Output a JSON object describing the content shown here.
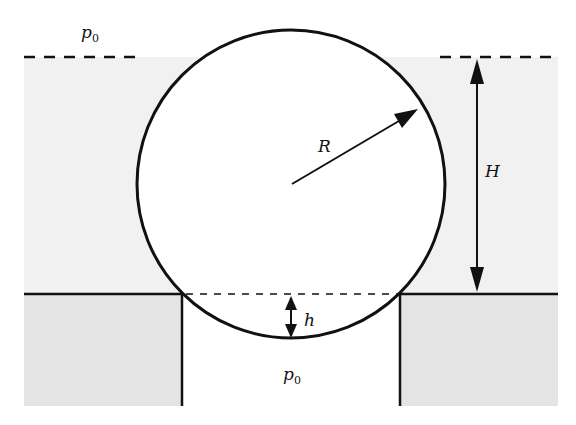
{
  "diagram": {
    "labels": {
      "pressure_top": {
        "symbol": "p",
        "subscript": "0"
      },
      "pressure_bottom": {
        "symbol": "p",
        "subscript": "0"
      },
      "radius": "R",
      "depth": "H",
      "protrusion": "h"
    },
    "colors": {
      "liquid_fill": "#f1f1f1",
      "solid_fill": "#e4e4e4",
      "stroke": "#111111",
      "background": "#ffffff"
    }
  }
}
